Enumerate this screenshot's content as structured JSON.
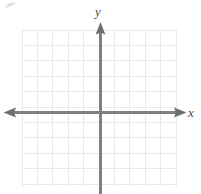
{
  "figure": {
    "type": "coordinate-plane",
    "title": "",
    "width": 201,
    "height": 194,
    "background_color": "#ffffff"
  },
  "chart_data": {
    "type": "scatter",
    "title": "",
    "xlabel": "x",
    "ylabel": "y",
    "x": [],
    "y": [],
    "series": [],
    "annotations": [],
    "legend": null,
    "legend_position": "none",
    "grid": true,
    "grid_spacing_units": 1,
    "xlim": [
      -5,
      5
    ],
    "ylim": [
      -5,
      5
    ],
    "xticks": [
      -5,
      -4,
      -3,
      -2,
      -1,
      0,
      1,
      2,
      3,
      4,
      5
    ],
    "yticks": [
      -5,
      -4,
      -3,
      -2,
      -1,
      0,
      1,
      2,
      3,
      4,
      5
    ],
    "xtick_labels": [],
    "ytick_labels": [],
    "axis_arrows": {
      "x_left": true,
      "x_right": true,
      "y_top": true,
      "y_bottom": false
    }
  },
  "axes": {
    "x_label": "x",
    "y_label": "y",
    "axis_color": "#808080",
    "grid_color": "#e9e9ec",
    "label_color": "#4a4a4a"
  },
  "grid": {
    "columns": 10,
    "rows": 10,
    "cell_size_px": 15.4,
    "left_px": 22,
    "top_px": 30,
    "right_px": 176,
    "bottom_px": 186
  },
  "origin": {
    "x_px": 100,
    "y_px": 112
  }
}
